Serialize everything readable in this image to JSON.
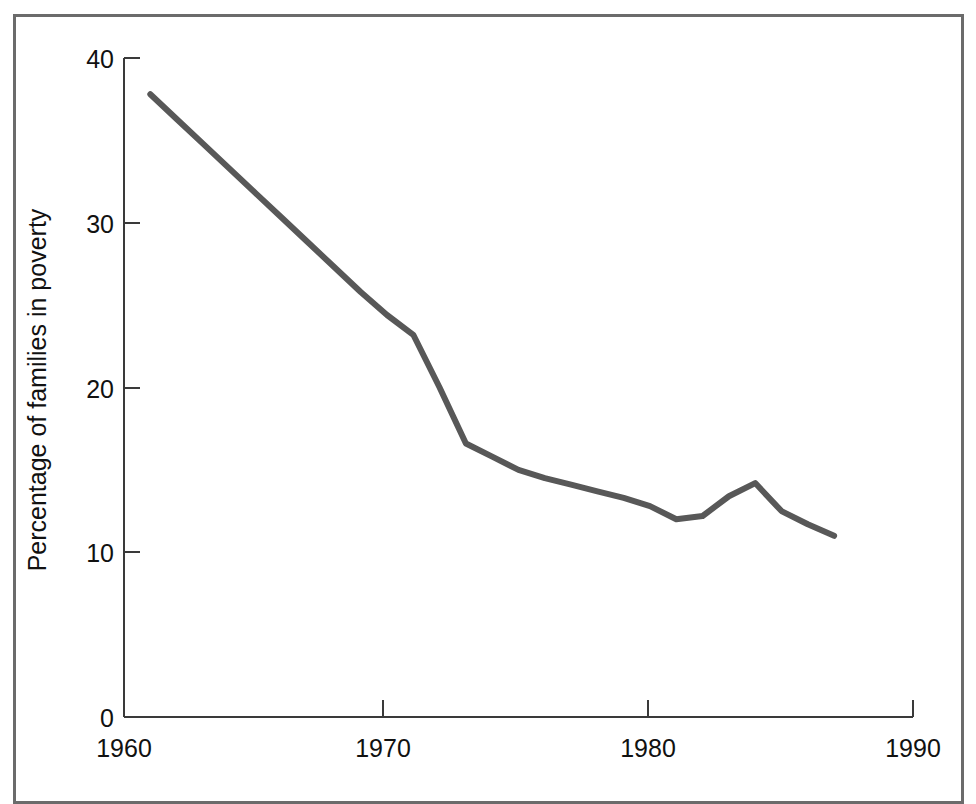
{
  "chart_data": {
    "type": "line",
    "title": "",
    "xlabel": "",
    "ylabel": "Percentage of families in poverty",
    "xlim": [
      1960,
      1990
    ],
    "ylim": [
      0,
      40
    ],
    "xticks": [
      1960,
      1970,
      1980,
      1990
    ],
    "xtick_labels": [
      "1960",
      "1970",
      "1980",
      "1990"
    ],
    "yticks": [
      0,
      10,
      20,
      30,
      40
    ],
    "ytick_labels": [
      "0",
      "10",
      "20",
      "30",
      "40"
    ],
    "grid": false,
    "legend": "none",
    "line_color": "#585858",
    "axis_color": "#3a3a3a",
    "frame_color": "#6b6b6b",
    "background_color": "#ffffff",
    "series": [
      {
        "name": "Percentage of families in poverty",
        "x": [
          1961,
          1962,
          1963,
          1964,
          1965,
          1966,
          1967,
          1968,
          1969,
          1970,
          1971,
          1972,
          1973,
          1974,
          1975,
          1976,
          1977,
          1978,
          1979,
          1980,
          1981,
          1982,
          1983,
          1984,
          1985,
          1986,
          1987
        ],
        "values": [
          37.8,
          36.3,
          34.8,
          33.3,
          31.8,
          30.3,
          28.8,
          27.3,
          25.8,
          24.4,
          23.2,
          20.0,
          16.6,
          15.8,
          15.0,
          14.5,
          14.1,
          13.7,
          13.3,
          12.8,
          12.0,
          12.2,
          13.4,
          14.2,
          12.5,
          11.7,
          11.0
        ]
      }
    ]
  },
  "axis": {
    "y_title": "Percentage of families in poverty"
  }
}
